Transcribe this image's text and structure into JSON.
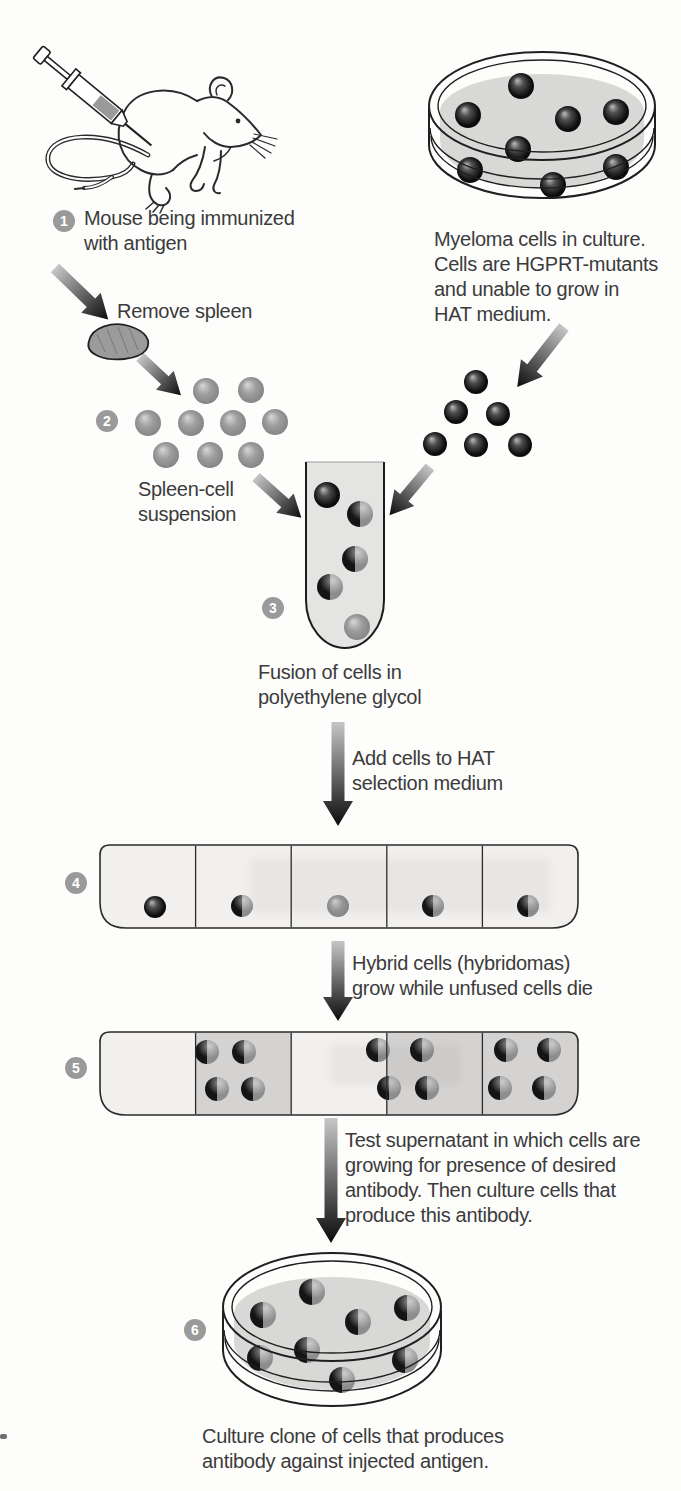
{
  "diagram": {
    "steps": [
      {
        "badge": "1",
        "caption": "Mouse being immunized\nwith antigen"
      },
      {
        "badge": "2",
        "caption": "Spleen-cell\nsuspension"
      },
      {
        "badge": "3",
        "caption": "Fusion of cells in\npolyethylene glycol"
      },
      {
        "badge": "4"
      },
      {
        "badge": "5"
      },
      {
        "badge": "6",
        "caption": "Culture clone of cells that produces\nantibody against injected antigen."
      }
    ],
    "annotations": {
      "myeloma_dish": "Myeloma cells in culture.\nCells are HGPRT-mutants\nand unable to grow in\nHAT medium.",
      "remove_spleen": "Remove spleen",
      "add_to_hat": "Add cells to HAT\nselection medium",
      "hybrids_grow": "Hybrid cells (hybridomas)\ngrow while unfused cells die",
      "test_supernatant": "Test supernatant in which cells are\ngrowing for presence of desired\nantibody. Then culture cells that\nproduce this antibody."
    },
    "colors": {
      "text": "#3b3b3b",
      "badge": "#9a9a9a",
      "myeloma_cell": "#0e0e0e",
      "spleen_cell": "#8f8f8f",
      "hybrid_dark": "#141414",
      "hybrid_gray": "#8d8d8d",
      "dish_medium": "#d8d8d6",
      "tube_fill": "#e4e4e2",
      "plate_fill": "#f1f0ee",
      "well_shaded": "#d4d3d1",
      "arrow_tail": "#c6c6c6",
      "arrow_head": "#0b0b0b"
    }
  }
}
